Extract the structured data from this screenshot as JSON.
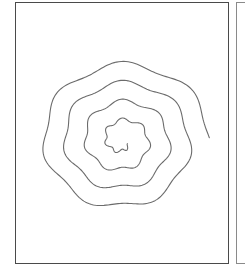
{
  "canvas": {
    "width": 245,
    "height": 266,
    "background": "#ffffff"
  },
  "frames": {
    "main": {
      "label": "",
      "border_color": "#4a4a4a"
    },
    "next": {
      "label": "",
      "border_color": "#8a8a8a"
    }
  },
  "spiral": {
    "description": "Wavy hand-drawn spiral",
    "center": [
      122,
      140
    ],
    "turns": 3.9,
    "start_radius": 8,
    "end_radius_x": 88,
    "end_radius_y": 80,
    "wave_count": 14,
    "wave_amplitude": 3.2,
    "stroke_color": "#6b6b6b",
    "stroke_width": 1.1
  }
}
